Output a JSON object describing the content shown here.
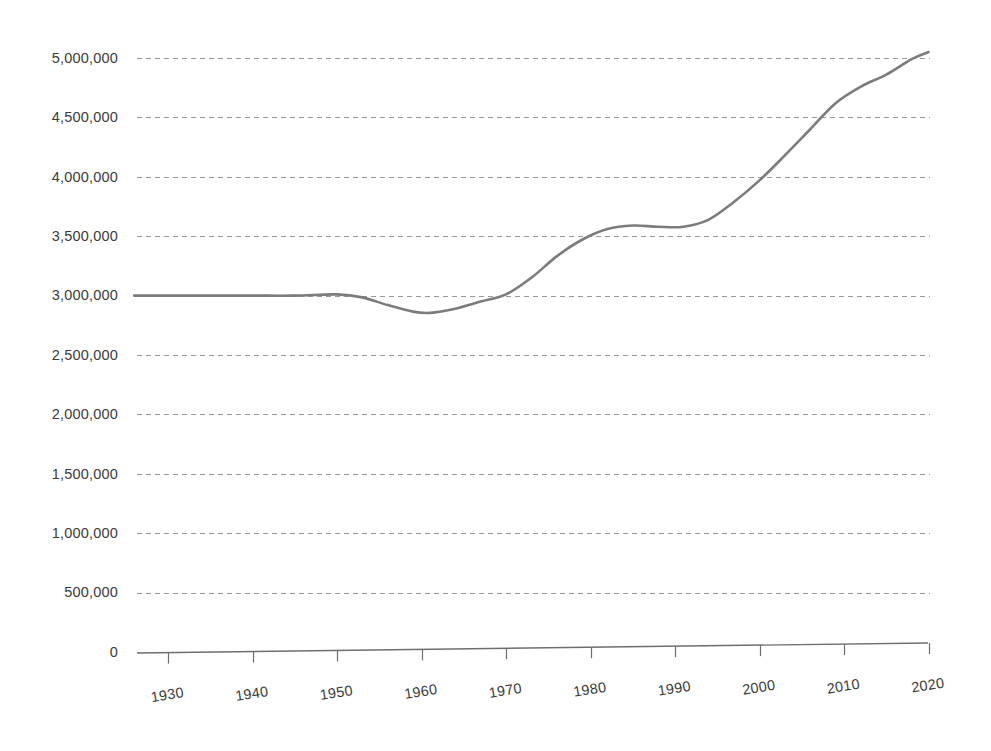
{
  "chart_data": {
    "type": "line",
    "title": "",
    "subtitle": "",
    "xlabel": "",
    "ylabel": "",
    "xlim": [
      1926,
      2020
    ],
    "ylim": [
      0,
      5000000
    ],
    "grid": true,
    "legend": false,
    "legend_position": "none",
    "line_color": "#7c7c7c",
    "grid_color": "#9a9a9a",
    "axis_color": "#6e6e6e",
    "text_color": "#3b3b3b",
    "background_color": "#ffffff",
    "y_ticks": [
      {
        "value": 0,
        "label": "0"
      },
      {
        "value": 500000,
        "label": "500,000"
      },
      {
        "value": 1000000,
        "label": "1,000,000"
      },
      {
        "value": 1500000,
        "label": "1,500,000"
      },
      {
        "value": 2000000,
        "label": "2,000,000"
      },
      {
        "value": 2500000,
        "label": "2,500,000"
      },
      {
        "value": 3000000,
        "label": "3,000,000"
      },
      {
        "value": 3500000,
        "label": "3,500,000"
      },
      {
        "value": 4000000,
        "label": "4,000,000"
      },
      {
        "value": 4500000,
        "label": "4,500,000"
      },
      {
        "value": 5000000,
        "label": "5,000,000"
      }
    ],
    "x_ticks": [
      {
        "value": 1930,
        "label": "1930"
      },
      {
        "value": 1940,
        "label": "1940"
      },
      {
        "value": 1950,
        "label": "1950"
      },
      {
        "value": 1960,
        "label": "1960"
      },
      {
        "value": 1970,
        "label": "1970"
      },
      {
        "value": 1980,
        "label": "1980"
      },
      {
        "value": 1990,
        "label": "1990"
      },
      {
        "value": 2000,
        "label": "2000"
      },
      {
        "value": 2010,
        "label": "2010"
      },
      {
        "value": 2020,
        "label": "2020"
      }
    ],
    "x": [
      1926,
      1930,
      1935,
      1940,
      1945,
      1950,
      1953,
      1956,
      1959,
      1961,
      1964,
      1967,
      1970,
      1973,
      1976,
      1979,
      1982,
      1985,
      1988,
      1991,
      1994,
      1997,
      2000,
      2003,
      2006,
      2009,
      2012,
      2015,
      2018,
      2020
    ],
    "values": [
      3000000,
      3000000,
      3000000,
      3000000,
      3000000,
      3010000,
      2985000,
      2920000,
      2865000,
      2855000,
      2890000,
      2950000,
      3010000,
      3150000,
      3330000,
      3470000,
      3560000,
      3590000,
      3580000,
      3580000,
      3640000,
      3790000,
      3970000,
      4180000,
      4400000,
      4620000,
      4760000,
      4860000,
      4990000,
      5050000
    ],
    "series": [
      {
        "name": "Population",
        "values": [
          3000000,
          3000000,
          3000000,
          3000000,
          3000000,
          3010000,
          2985000,
          2920000,
          2865000,
          2855000,
          2890000,
          2950000,
          3010000,
          3150000,
          3330000,
          3470000,
          3560000,
          3590000,
          3580000,
          3580000,
          3640000,
          3790000,
          3970000,
          4180000,
          4400000,
          4620000,
          4760000,
          4860000,
          4990000,
          5050000
        ]
      }
    ],
    "annotations": []
  },
  "layout": {
    "plot_left": 137,
    "plot_right": 928,
    "plot_top": 58,
    "axis_y": 650,
    "x_start_year": 1926.3,
    "x_end_year": 2020,
    "px_per_decade": 84.5,
    "first_tick_x": 168,
    "y_zero_px": 652,
    "px_per_500k": 59.4,
    "xtick_rotation_deg": -9
  }
}
